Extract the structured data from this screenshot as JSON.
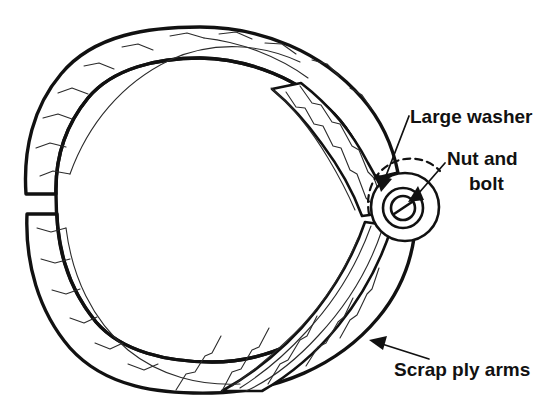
{
  "figure": {
    "name": "tyre-ring-with-scrap-ply-arms",
    "background_color": "#ffffff",
    "ink_color": "#111111",
    "ply_line_color": "#2b2b2b"
  },
  "labels": [
    {
      "id": "large-washer",
      "text": "Large washer",
      "x": 410,
      "y": 123,
      "anchor": "start"
    },
    {
      "id": "nut-and-bolt-line1",
      "text": "Nut and",
      "x": 447,
      "y": 165,
      "anchor": "start"
    },
    {
      "id": "nut-and-bolt-line2",
      "text": "bolt",
      "x": 469,
      "y": 190,
      "anchor": "start"
    },
    {
      "id": "scrap-ply-arms",
      "text": "Scrap ply arms",
      "x": 394,
      "y": 376,
      "anchor": "start"
    }
  ],
  "components": {
    "outer_ring": {
      "name": "tyre-carcass-ring",
      "center_x": 208,
      "center_y": 211,
      "outer_radius_x": 186,
      "outer_radius_y": 182,
      "inner_radius_x": 158,
      "inner_radius_y": 154,
      "gap_description": "split at left side of ring"
    },
    "hub": {
      "name": "bolted-hub",
      "center_x": 403,
      "center_y": 208,
      "washer_radius": 34,
      "bolt_head_outer_radius": 21,
      "bolt_head_inner_radius": 13,
      "bolt_slot": "diagonal screwdriver slot"
    },
    "arms": {
      "name": "scrap-ply-arms",
      "count": 2,
      "description": "two tapered plies running from the ring band to the bolted hub"
    }
  },
  "leaders": [
    {
      "id": "leader-large-washer",
      "from_x": 408,
      "from_y": 118,
      "to_x": 381,
      "to_y": 186
    },
    {
      "id": "leader-nut-and-bolt",
      "from_x": 444,
      "from_y": 166,
      "to_x": 411,
      "to_y": 199
    },
    {
      "id": "leader-scrap-ply-arms",
      "from_x": 425,
      "from_y": 358,
      "to_x": 371,
      "to_y": 340
    }
  ]
}
